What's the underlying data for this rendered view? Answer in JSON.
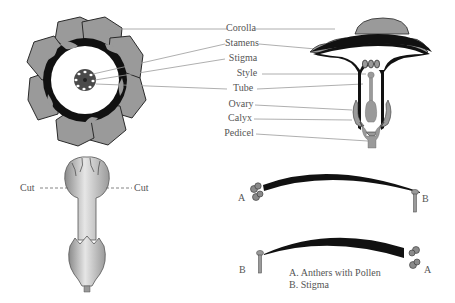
{
  "diagram": {
    "colors": {
      "petal_fill": "#9a9a9a",
      "petal_outline": "#2a2a2a",
      "dark_band": "#111111",
      "leader_line": "#9a9a9a",
      "label_text": "#555555",
      "background": "#ffffff"
    },
    "top_view": {
      "name": "Flower top view (cross-section)",
      "petal_count": 8
    },
    "section_view": {
      "name": "Flower longitudinal section"
    },
    "labels": [
      {
        "id": "corolla",
        "text": "Corolla"
      },
      {
        "id": "stamens",
        "text": "Stamens"
      },
      {
        "id": "stigma",
        "text": "Stigma"
      },
      {
        "id": "style",
        "text": "Style"
      },
      {
        "id": "tube",
        "text": "Tube"
      },
      {
        "id": "ovary",
        "text": "Ovary"
      },
      {
        "id": "calyx",
        "text": "Calyx"
      },
      {
        "id": "pedicel",
        "text": "Pedicel"
      }
    ],
    "side_view": {
      "name": "Flower side view",
      "cut_left": "Cut",
      "cut_right": "Cut"
    },
    "pollination": {
      "top": {
        "left_marker": "A",
        "right_marker": "B"
      },
      "bottom": {
        "left_marker": "B",
        "right_marker": "A"
      },
      "legend": [
        "A. Anthers with Pollen",
        "B. Stigma"
      ]
    }
  }
}
